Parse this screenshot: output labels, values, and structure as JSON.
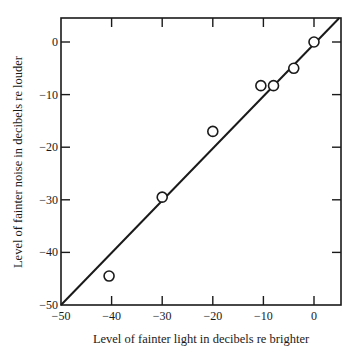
{
  "chart_data": {
    "type": "scatter",
    "title": "",
    "xlabel": "Level of fainter light in decibels re brighter",
    "ylabel": "Level of fainter noise in decibels re louder",
    "xlim": [
      -50,
      5
    ],
    "ylim": [
      -50,
      5
    ],
    "x_ticks": [
      -50,
      -40,
      -30,
      -20,
      -10,
      0
    ],
    "y_ticks": [
      -50,
      -40,
      -30,
      -20,
      -10,
      0
    ],
    "x_tick_labels": [
      "−50",
      "−40",
      "−30",
      "−20",
      "−10",
      "0"
    ],
    "y_tick_labels": [
      "−50",
      "−40",
      "−30",
      "−20",
      "−10",
      "0"
    ],
    "grid": false,
    "legend": null,
    "series": [
      {
        "name": "observations",
        "marker": "open-circle",
        "points": [
          {
            "x": 0,
            "y": 0
          },
          {
            "x": -4,
            "y": -5
          },
          {
            "x": -8,
            "y": -8.3
          },
          {
            "x": -10.5,
            "y": -8.3
          },
          {
            "x": -20,
            "y": -17
          },
          {
            "x": -30,
            "y": -29.5
          },
          {
            "x": -40.5,
            "y": -44.5
          }
        ]
      },
      {
        "name": "equality line (y = x)",
        "type": "line",
        "points": [
          {
            "x": -50,
            "y": -50
          },
          {
            "x": 5,
            "y": 5
          }
        ]
      }
    ]
  },
  "colors": {
    "ink": "#1a1a1a",
    "background": "#ffffff"
  }
}
